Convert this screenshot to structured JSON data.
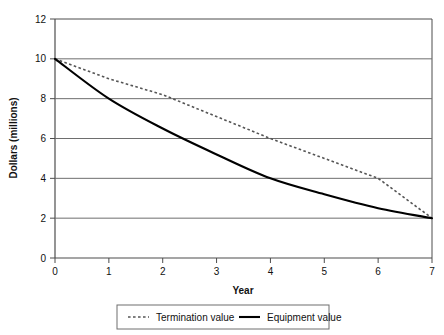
{
  "chart_data": {
    "type": "line",
    "title": "",
    "xlabel": "Year",
    "ylabel": "Dollars (millions)",
    "xlim": [
      0,
      7
    ],
    "ylim": [
      0,
      12
    ],
    "xticks": [
      0,
      1,
      2,
      3,
      4,
      5,
      6,
      7
    ],
    "yticks": [
      0,
      2,
      4,
      6,
      8,
      10,
      12
    ],
    "xtick_labels": [
      "0",
      "1",
      "2",
      "3",
      "4",
      "5",
      "6",
      "7"
    ],
    "ytick_labels": [
      "0",
      "2",
      "4",
      "6",
      "8",
      "10",
      "12"
    ],
    "grid": "horizontal",
    "legend_position": "bottom",
    "series": [
      {
        "name": "Termination value",
        "style": "dotted",
        "color": "#555555",
        "x": [
          0,
          1,
          2,
          3,
          4,
          5,
          6,
          7
        ],
        "values": [
          10.0,
          9.0,
          8.2,
          7.1,
          6.0,
          5.0,
          4.0,
          2.0
        ]
      },
      {
        "name": "Equipment value",
        "style": "solid",
        "color": "#000000",
        "x": [
          0,
          1,
          2,
          3,
          4,
          5,
          6,
          7
        ],
        "values": [
          10.0,
          8.0,
          6.5,
          5.2,
          4.0,
          3.2,
          2.5,
          2.0
        ]
      }
    ]
  },
  "axes": {
    "y_axis_title": "Dollars (millions)",
    "x_axis_title": "Year"
  },
  "legend": {
    "items": [
      {
        "label": "Termination value",
        "style": "dotted"
      },
      {
        "label": "Equipment value",
        "style": "solid"
      }
    ]
  },
  "colors": {
    "axis": "#4d4d4d",
    "grid": "#6e6e6e",
    "solid_series": "#000000",
    "dotted_series": "#555555",
    "text": "#111111",
    "legend_border": "#6e6e6e",
    "background": "#ffffff"
  }
}
